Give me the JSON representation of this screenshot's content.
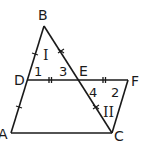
{
  "diagram": {
    "colors": {
      "stroke": "#1a1a1a",
      "background": "#ffffff"
    },
    "points": {
      "A": {
        "label": "A",
        "x": 11,
        "y": 133
      },
      "B": {
        "label": "B",
        "x": 44,
        "y": 26
      },
      "C": {
        "label": "C",
        "x": 112,
        "y": 133
      },
      "D": {
        "label": "D",
        "x": 27,
        "y": 80
      },
      "E": {
        "label": "E",
        "x": 78,
        "y": 80
      },
      "F": {
        "label": "F",
        "x": 128,
        "y": 80
      }
    },
    "segments": [
      "AB",
      "BC",
      "AC",
      "DF",
      "FC"
    ],
    "angles": {
      "a1": "1",
      "a2": "2",
      "a3": "3",
      "a4": "4"
    },
    "regions": {
      "r1": "I",
      "r2": "II"
    },
    "tick_marks": [
      {
        "segment": "BD",
        "type": "single"
      },
      {
        "segment": "DA",
        "type": "single"
      },
      {
        "segment": "BE",
        "type": "x"
      },
      {
        "segment": "EC",
        "type": "x"
      },
      {
        "segment": "DE",
        "type": "double"
      },
      {
        "segment": "EF",
        "type": "double"
      }
    ]
  }
}
